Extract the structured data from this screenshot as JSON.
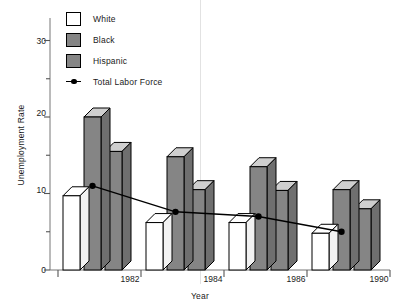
{
  "chart_data": {
    "type": "bar",
    "title": "",
    "xlabel": "Year",
    "ylabel": "Unemployment Rate",
    "categories": [
      "1982",
      "1984",
      "1986",
      "1990"
    ],
    "ylim": [
      0,
      32
    ],
    "yticks_major": [
      0,
      10,
      20,
      30
    ],
    "yticks_minor": [
      5,
      15,
      25
    ],
    "grid": false,
    "legend_position": "top-left",
    "series": [
      {
        "name": "White",
        "type": "bar",
        "color": "#ffffff",
        "values": [
          9.7,
          6.2,
          6.2,
          4.8
        ]
      },
      {
        "name": "Black",
        "type": "bar",
        "color": "#858585",
        "values": [
          20.0,
          14.8,
          13.5,
          10.5
        ]
      },
      {
        "name": "Hispanic",
        "type": "bar",
        "color": "#858585",
        "values": [
          15.5,
          10.5,
          10.4,
          8.0
        ]
      },
      {
        "name": "Total Labor Force",
        "type": "line",
        "color": "#000000",
        "values": [
          11.0,
          7.6,
          7.0,
          5.0
        ]
      }
    ]
  },
  "legend": {
    "items": [
      {
        "label": "White",
        "swatch": "white-box-icon"
      },
      {
        "label": "Black",
        "swatch": "gray-box-icon"
      },
      {
        "label": "Hispanic",
        "swatch": "gray-box-icon"
      },
      {
        "label": "Total Labor Force",
        "swatch": "line-marker-icon"
      }
    ]
  },
  "axes": {
    "y_title": "Unemployment Rate",
    "x_title": "Year",
    "y_labels": [
      "0",
      "10",
      "20",
      "30"
    ],
    "x_labels": [
      "1982",
      "1984",
      "1986",
      "1990"
    ]
  }
}
